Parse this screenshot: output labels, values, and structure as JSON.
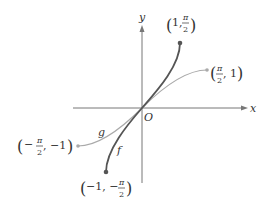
{
  "diagram": {
    "axes": {
      "x_label": "x",
      "y_label": "y",
      "origin_label": "O"
    },
    "curves": [
      {
        "name": "f",
        "label": "f",
        "color": "#555555",
        "description": "arcsin"
      },
      {
        "name": "g",
        "label": "g",
        "color": "#aaaaaa",
        "description": "sin"
      }
    ],
    "points": {
      "f_top": {
        "open": "(",
        "a": "1,",
        "num": "π",
        "den": "2",
        "close": ")"
      },
      "f_bottom": {
        "open": "(",
        "a": "−1, −",
        "num": "π",
        "den": "2",
        "close": ")"
      },
      "g_right": {
        "open": "(",
        "num": "π",
        "den": "2",
        "b": ", 1",
        "close": ")"
      },
      "g_left": {
        "open": "(",
        "neg": "−",
        "num": "π",
        "den": "2",
        "b": ", −1",
        "close": ")"
      }
    },
    "colors": {
      "axis": "#777777",
      "f": "#555555",
      "g": "#aaaaaa"
    }
  }
}
